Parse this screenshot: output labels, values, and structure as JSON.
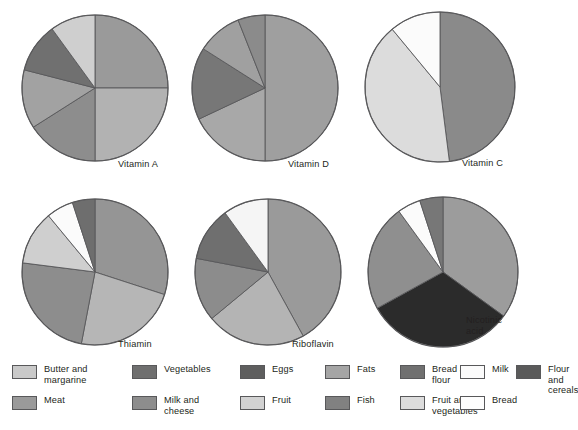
{
  "figure": {
    "kind": "pie-chart-panel",
    "background": "#ffffff",
    "outline_color": "#58585a"
  },
  "palette": {
    "butter_and_margarine": "#c9c9c9",
    "meat": "#9a9a9a",
    "vegetables": "#6f6f6f",
    "milk_and_cheese": "#8d8d8d",
    "eggs": "#5e5e5e",
    "fruit": "#d2d2d2",
    "fats": "#a5a5a5",
    "fish": "#818181",
    "bread_and_flour": "#707070",
    "fruit_and_vegetables": "#dcdcdc",
    "milk": "#fbfbfb",
    "bread": "#fdfdfd",
    "flour_and_cereals": "#5a5a5a",
    "nicotinic_dark": "#2b2b2b"
  },
  "legend": {
    "name": "food-source-legend",
    "items": [
      {
        "label": "Butter and\nmargarine",
        "color": "#c9c9c9",
        "col": 0,
        "row": 0
      },
      {
        "label": "Meat",
        "color": "#9a9a9a",
        "col": 0,
        "row": 1
      },
      {
        "label": "Vegetables",
        "color": "#6f6f6f",
        "col": 1,
        "row": 0
      },
      {
        "label": "Milk and\ncheese",
        "color": "#8d8d8d",
        "col": 1,
        "row": 1
      },
      {
        "label": "Eggs",
        "color": "#5e5e5e",
        "col": 2,
        "row": 0
      },
      {
        "label": "Fruit",
        "color": "#d2d2d2",
        "col": 2,
        "row": 1
      },
      {
        "label": "Fats",
        "color": "#a5a5a5",
        "col": 3,
        "row": 0
      },
      {
        "label": "Fish",
        "color": "#818181",
        "col": 3,
        "row": 1
      },
      {
        "label": "Bread and\nflour",
        "color": "#707070",
        "col": 4,
        "row": 0
      },
      {
        "label": "Fruit and\nvegetables",
        "color": "#dcdcdc",
        "col": 4,
        "row": 1
      },
      {
        "label": "Milk",
        "color": "#fbfbfb",
        "col": 5,
        "row": 0
      },
      {
        "label": "Bread",
        "color": "#fdfdfd",
        "col": 5,
        "row": 1
      },
      {
        "label": "Flour and\ncereals",
        "color": "#5a5a5a",
        "col": 6,
        "row": 0
      }
    ]
  },
  "chart_data": [
    {
      "type": "pie",
      "name": "vitamin-a",
      "title": "Vitamin A",
      "startangle_deg": 90,
      "direction": "clockwise",
      "labels": [
        "Milk and cheese",
        "Meat",
        "Fats",
        "Vegetables",
        "Eggs",
        "Butter and margarine"
      ],
      "values": [
        25,
        25,
        16,
        13,
        11,
        10
      ],
      "colors": [
        "#9a9a9a",
        "#b2b2b2",
        "#8d8d8d",
        "#a2a2a2",
        "#707070",
        "#cfcfcf"
      ]
    },
    {
      "type": "pie",
      "name": "vitamin-d",
      "title": "Vitamin D",
      "startangle_deg": 90,
      "direction": "clockwise",
      "labels": [
        "Margarine and fats",
        "Milk and cheese",
        "Fish",
        "Meat",
        "Eggs"
      ],
      "values": [
        50,
        18,
        16,
        10,
        6
      ],
      "colors": [
        "#9f9f9f",
        "#a8a8a8",
        "#777777",
        "#a0a0a0",
        "#8b8b8b"
      ]
    },
    {
      "type": "pie",
      "name": "vitamin-c",
      "title": "Vitamin C",
      "startangle_deg": 90,
      "direction": "clockwise",
      "labels": [
        "Vegetables",
        "Fruit and vegetables",
        "Fruit"
      ],
      "values": [
        48,
        41,
        11
      ],
      "colors": [
        "#8a8a8a",
        "#dcdcdc",
        "#fbfbfb"
      ]
    },
    {
      "type": "pie",
      "name": "thiamin",
      "title": "Thiamin",
      "startangle_deg": 90,
      "direction": "clockwise",
      "labels": [
        "Bread and flour",
        "Vegetables",
        "Meat",
        "Fruit",
        "Milk",
        "Eggs"
      ],
      "values": [
        30,
        23,
        24,
        12,
        6,
        5
      ],
      "colors": [
        "#959595",
        "#b6b6b6",
        "#8d8d8d",
        "#cfcfcf",
        "#fbfbfb",
        "#6e6e6e"
      ]
    },
    {
      "type": "pie",
      "name": "riboflavin",
      "title": "Riboflavin",
      "startangle_deg": 90,
      "direction": "clockwise",
      "labels": [
        "Milk and cheese",
        "Meat",
        "Vegetables",
        "Bread and flour",
        "Eggs"
      ],
      "values": [
        42,
        22,
        14,
        12,
        10
      ],
      "colors": [
        "#9a9a9a",
        "#b4b4b4",
        "#8c8c8c",
        "#6f6f6f",
        "#f5f5f5"
      ]
    },
    {
      "type": "pie",
      "name": "nicotinic-acid",
      "title": "Nicotinic\nacid",
      "startangle_deg": 90,
      "direction": "clockwise",
      "labels": [
        "Meat",
        "Flour and cereals",
        "Vegetables",
        "Bread",
        "Milk"
      ],
      "values": [
        35,
        32,
        23,
        5,
        5
      ],
      "colors": [
        "#9c9c9c",
        "#2b2b2b",
        "#8f8f8f",
        "#fbfbfb",
        "#777777"
      ]
    }
  ],
  "pie_layout": [
    {
      "cx": 95,
      "cy": 88,
      "r": 73,
      "label_x": 118,
      "label_y": 159
    },
    {
      "cx": 265,
      "cy": 88,
      "r": 73,
      "label_x": 288,
      "label_y": 159
    },
    {
      "cx": 440,
      "cy": 87,
      "r": 75,
      "label_x": 462,
      "label_y": 158
    },
    {
      "cx": 95,
      "cy": 272,
      "r": 73,
      "label_x": 118,
      "label_y": 339
    },
    {
      "cx": 268,
      "cy": 272,
      "r": 73,
      "label_x": 292,
      "label_y": 339
    },
    {
      "cx": 443,
      "cy": 272,
      "r": 75,
      "label_x": 466,
      "label_y": 315
    }
  ]
}
